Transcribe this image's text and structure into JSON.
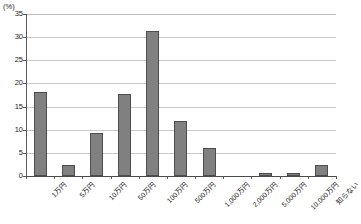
{
  "chart_data": {
    "type": "bar",
    "title": "",
    "xlabel": "",
    "ylabel": "(%)",
    "yunit": "(%)",
    "ylim": [
      0,
      35
    ],
    "ytick_step": 5,
    "grid": true,
    "legend": false,
    "orientation": "vertical",
    "bar_color": "#808080",
    "bar_border_color": "#4d4d4d",
    "gridline_color": "#c9c9c9",
    "axis_color": "#5a5a5a",
    "categories": [
      "1万円",
      "5万円",
      "10万円",
      "50万円",
      "100万円",
      "500万円",
      "1,000万円",
      "2,000万円",
      "5,000万円",
      "10,000万円",
      "知らない"
    ],
    "values": [
      18.2,
      2.3,
      9.2,
      17.8,
      31.3,
      11.9,
      6.0,
      0,
      0.6,
      0.6,
      2.3
    ],
    "yticks": [
      0,
      5,
      10,
      15,
      20,
      25,
      30,
      35
    ],
    "ytick_labels": [
      "0",
      "5",
      "10",
      "15",
      "20",
      "25",
      "30",
      "35"
    ]
  }
}
